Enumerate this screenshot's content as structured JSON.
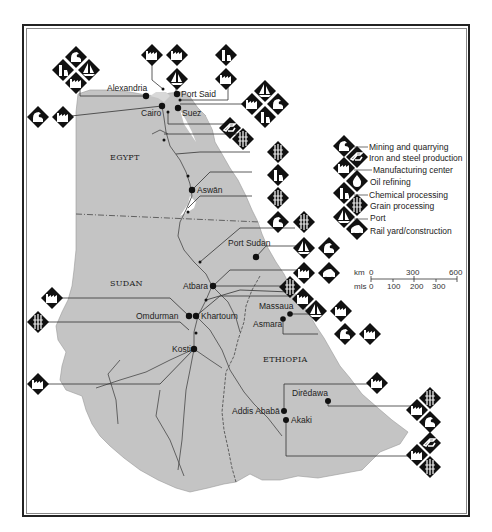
{
  "map": {
    "countries": [
      {
        "name": "EGYPT",
        "x": 115,
        "y": 160
      },
      {
        "name": "SUDAN",
        "x": 110,
        "y": 286
      },
      {
        "name": "ETHIOPIA",
        "x": 263,
        "y": 362
      }
    ],
    "cities": [
      {
        "name": "Alexandria",
        "x": 146,
        "y": 96,
        "lx": 107,
        "ly": 91
      },
      {
        "name": "Port Said",
        "x": 177,
        "y": 94,
        "lx": 181,
        "ly": 97
      },
      {
        "name": "Cairo",
        "x": 162,
        "y": 106,
        "lx": 141,
        "ly": 114
      },
      {
        "name": "Suez",
        "x": 178,
        "y": 108,
        "lx": 182,
        "ly": 114
      },
      {
        "name": "Aswān",
        "x": 192,
        "y": 190,
        "lx": 197,
        "ly": 193
      },
      {
        "name": "Port Sudan",
        "x": 256,
        "y": 257,
        "lx": 228,
        "ly": 246
      },
      {
        "name": "Atbara",
        "x": 213,
        "y": 286,
        "lx": 183,
        "ly": 288
      },
      {
        "name": "Omdurman",
        "x": 189,
        "y": 316,
        "lx": 136,
        "ly": 319
      },
      {
        "name": "Khartoum",
        "x": 196,
        "y": 316,
        "lx": 201,
        "ly": 319
      },
      {
        "name": "Massaua",
        "x": 290,
        "y": 314,
        "lx": 259,
        "ly": 309
      },
      {
        "name": "Asmara",
        "x": 283,
        "y": 319,
        "lx": 253,
        "ly": 327
      },
      {
        "name": "Kosti",
        "x": 194,
        "y": 349,
        "lx": 172,
        "ly": 351
      },
      {
        "name": "Dirēdawa",
        "x": 328,
        "y": 401,
        "lx": 292,
        "ly": 396
      },
      {
        "name": "Addis Ababā",
        "x": 284,
        "y": 411,
        "lx": 232,
        "ly": 414
      },
      {
        "name": "Akaki",
        "x": 286,
        "y": 420,
        "lx": 291,
        "ly": 423
      }
    ]
  },
  "legend": {
    "items": [
      {
        "icon": "mining-icon",
        "label": "Mining and quarrying"
      },
      {
        "icon": "iron-steel-icon",
        "label": "Iron and steel production"
      },
      {
        "icon": "manufacturing-icon",
        "label": "Manufacturing center"
      },
      {
        "icon": "oil-refining-icon",
        "label": "Oil refining"
      },
      {
        "icon": "chemical-icon",
        "label": "Chemical processing"
      },
      {
        "icon": "grain-icon",
        "label": "Grain processing"
      },
      {
        "icon": "port-icon",
        "label": "Port"
      },
      {
        "icon": "rail-icon",
        "label": "Rail yard/construction"
      }
    ]
  },
  "scale": {
    "km_label": "km",
    "km_ticks": [
      "0",
      "300",
      "600"
    ],
    "mls_label": "mls",
    "mls_ticks": [
      "0",
      "100",
      "200",
      "300"
    ]
  },
  "colors": {
    "land": "#c4c4c4",
    "water": "#ffffff",
    "ink": "#111111",
    "frame": "#222222"
  }
}
